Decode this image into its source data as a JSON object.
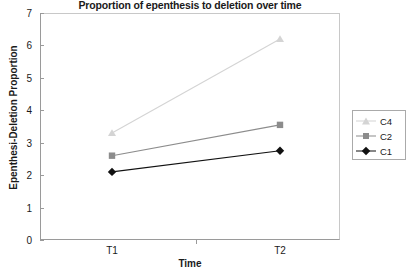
{
  "chart_data": {
    "type": "line",
    "title": "Proportion of epenthesis to deletion over time",
    "xlabel": "Time",
    "ylabel": "Epenthesi-Deletion Proportion",
    "categories": [
      "T1",
      "T2"
    ],
    "ylim": [
      0,
      7
    ],
    "yticks": [
      0,
      1,
      2,
      3,
      4,
      5,
      6,
      7
    ],
    "ytick_labels": [
      "0",
      "1",
      "2",
      "3",
      "4",
      "5",
      "6",
      "7"
    ],
    "grid": false,
    "legend_position": "right",
    "series": [
      {
        "name": "C4",
        "values": [
          3.3,
          6.2
        ],
        "color": "#d4d4d4",
        "marker": "triangle"
      },
      {
        "name": "C2",
        "values": [
          2.6,
          3.55
        ],
        "color": "#8c8c8c",
        "marker": "square"
      },
      {
        "name": "C1",
        "values": [
          2.1,
          2.75
        ],
        "color": "#111111",
        "marker": "diamond"
      }
    ]
  },
  "legend": {
    "items": [
      {
        "label": "C4"
      },
      {
        "label": "C2"
      },
      {
        "label": "C1"
      }
    ]
  }
}
